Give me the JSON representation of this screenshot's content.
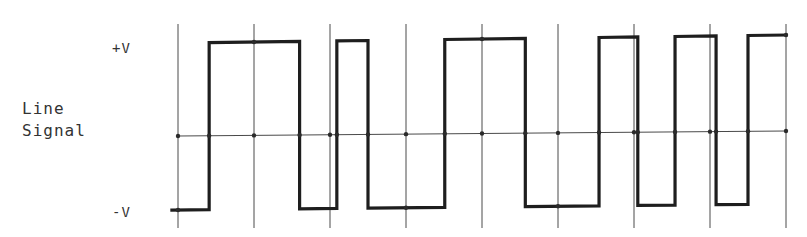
{
  "labels": {
    "positive": "+V",
    "negative": "-V",
    "title_line1": "Line",
    "title_line2": "Signal",
    "title": "Line\nSignal"
  },
  "colors": {
    "waveform": "#1e1e1e",
    "grid": "#4a4a4a",
    "background": "#ffffff"
  },
  "diagram": {
    "type": "line-coded digital waveform",
    "bit_periods": 8,
    "levels": {
      "high": "+V",
      "low": "-V",
      "zero": "0"
    },
    "start_level": "low",
    "transitions": [
      {
        "t": 0.41,
        "to": "high"
      },
      {
        "t": 1.6,
        "to": "low"
      },
      {
        "t": 2.09,
        "to": "high"
      },
      {
        "t": 2.5,
        "to": "low"
      },
      {
        "t": 3.51,
        "to": "high"
      },
      {
        "t": 4.57,
        "to": "low"
      },
      {
        "t": 5.54,
        "to": "high"
      },
      {
        "t": 6.05,
        "to": "low"
      },
      {
        "t": 6.54,
        "to": "high"
      },
      {
        "t": 7.08,
        "to": "low"
      },
      {
        "t": 7.5,
        "to": "high"
      }
    ],
    "t_start": -0.08,
    "t_end": 8.0
  }
}
